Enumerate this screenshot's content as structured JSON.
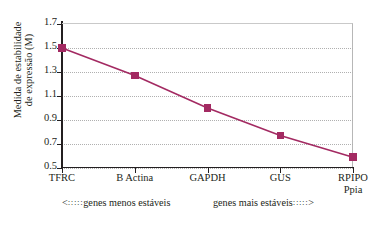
{
  "chart_data": {
    "type": "line",
    "title": "",
    "xlabel": "",
    "ylabel": "Medida de estabilidade de expressão (M)",
    "ylabel_lines": [
      "Medida de estabilidade",
      "de expressão (M)"
    ],
    "categories": [
      "TFRC",
      "B Actina",
      "GAPDH",
      "GUS",
      "RPIPO Ppia"
    ],
    "category_lines": [
      [
        "TFRC"
      ],
      [
        "B Actina"
      ],
      [
        "GAPDH"
      ],
      [
        "GUS"
      ],
      [
        "RPIPO",
        "Ppia"
      ]
    ],
    "values": [
      1.5,
      1.27,
      1.0,
      0.77,
      0.59
    ],
    "ylim": [
      0.5,
      1.7
    ],
    "yticks": [
      "1.7",
      "1.5",
      "1.3",
      "1.1",
      "0.9",
      "0.7",
      "0.5"
    ],
    "ytick_values": [
      1.7,
      1.5,
      1.3,
      1.1,
      0.9,
      0.7,
      0.5
    ],
    "grid": true,
    "grid_axis": "y",
    "legend": "none",
    "series_color": "#a32a62",
    "marker": "square",
    "annotations": [
      {
        "text": "genes menos estáveis",
        "arrow": "left",
        "lead": ":::::"
      },
      {
        "text": "genes mais estáveis",
        "arrow": "right",
        "lead": ":::::"
      }
    ]
  },
  "notes": {
    "left_arrow": "<",
    "left_lead": ":::::",
    "left_text": "genes menos estáveis",
    "right_text": "genes mais estáveis",
    "right_lead": ":::::",
    "right_arrow": ">"
  }
}
